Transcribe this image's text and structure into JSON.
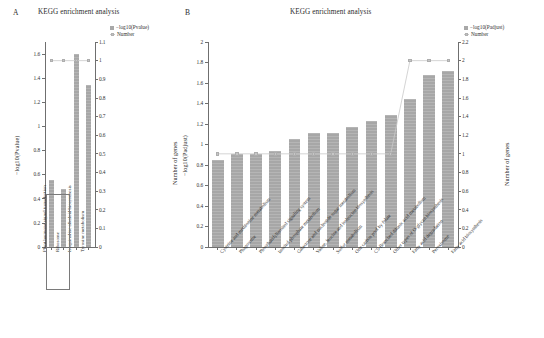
{
  "figure": {
    "panel_a": {
      "letter": "A",
      "title": "KEGG enrichment analysis",
      "legend": [
        {
          "key": "bar",
          "label": "−log10(Pvalue)"
        },
        {
          "key": "line",
          "label": "Number"
        }
      ],
      "y_left_title": "−log10(Pvalue)",
      "y_right_title": "Number of genes",
      "y_left_ticks": [
        "0",
        "0.2",
        "0.4",
        "0.6",
        "0.8",
        "1",
        "1.2",
        "1.4",
        "1.6"
      ],
      "y_right_ticks": [
        "0",
        "0.1",
        "0.2",
        "0.3",
        "0.4",
        "0.5",
        "0.6",
        "0.7",
        "0.8",
        "0.9",
        "1",
        "1.1"
      ]
    },
    "panel_b": {
      "letter": "B",
      "title": "KEGG enrichment analysis",
      "legend": [
        {
          "key": "bar",
          "label": "−log10(Padjust)"
        },
        {
          "key": "line",
          "label": "Number"
        }
      ],
      "y_left_title": "−log10(Padjust)",
      "y_right_title": "Number of genes",
      "y_left_ticks": [
        "0",
        "0.2",
        "0.4",
        "0.6",
        "0.8",
        "1",
        "1.2",
        "1.4",
        "1.6",
        "1.8",
        "2"
      ],
      "y_right_ticks": [
        "0",
        "0.2",
        "0.4",
        "0.6",
        "0.8",
        "1",
        "1.2",
        "1.4",
        "1.6",
        "1.8",
        "2",
        "2.2"
      ]
    }
  },
  "chart_data": [
    {
      "type": "bar",
      "panel": "A",
      "title": "KEGG enrichment analysis",
      "xlabel": "",
      "ylabel": "−log10(Pvalue)",
      "y2label": "Number of genes",
      "ylim": [
        0,
        1.7
      ],
      "y2lim": [
        0,
        1.1
      ],
      "grid": false,
      "legend_position": "top-right",
      "categories": [
        "Plant hormone signal transduction",
        "Ribosome",
        "Isoquinoline alkaloid biosynthesis",
        "Tyrosine metabolism"
      ],
      "series": [
        {
          "name": "−log10(Pvalue)",
          "type": "bar",
          "axis": "left",
          "values": [
            0.555,
            0.485,
            1.6,
            1.345
          ]
        },
        {
          "name": "Number",
          "type": "line",
          "axis": "right",
          "values": [
            1,
            1,
            1,
            1
          ]
        }
      ],
      "highlight_box": {
        "from_category_index": 0,
        "to_category_index": 1,
        "note": "box around first two bars"
      }
    },
    {
      "type": "bar",
      "panel": "B",
      "title": "KEGG enrichment analysis",
      "xlabel": "",
      "ylabel": "−log10(Padjust)",
      "y2label": "Number of genes",
      "ylim": [
        0,
        2.0
      ],
      "y2lim": [
        0,
        2.2
      ],
      "grid": false,
      "legend_position": "top-right",
      "categories": [
        "Cysteine and methionine metabolism",
        "Phagosome",
        "Phosphatidylinositol signaling system",
        "Inositol phosphate metabolism",
        "Galactose and nucleotide sugar metabolism",
        "Valine, leucine and isoleucine biosynthesis",
        "Sulfur metabolism",
        "One carbon pool by folate",
        "C5-Branched dibasic acid metabolism",
        "Other types of O-glycan biosynthesis",
        "Fatty acid degradation",
        "Peroxisome",
        "Fatty acid biosynthesis"
      ],
      "series": [
        {
          "name": "−log10(Padjust)",
          "type": "bar",
          "axis": "left",
          "values": [
            0.85,
            0.91,
            0.91,
            0.935,
            1.05,
            1.11,
            1.115,
            1.175,
            1.225,
            1.29,
            1.44,
            1.68,
            1.72
          ]
        },
        {
          "name": "Number",
          "type": "line",
          "axis": "right",
          "values": [
            1,
            1,
            1,
            1,
            1,
            1,
            1,
            1,
            1,
            1,
            2,
            2,
            2
          ]
        }
      ]
    }
  ]
}
